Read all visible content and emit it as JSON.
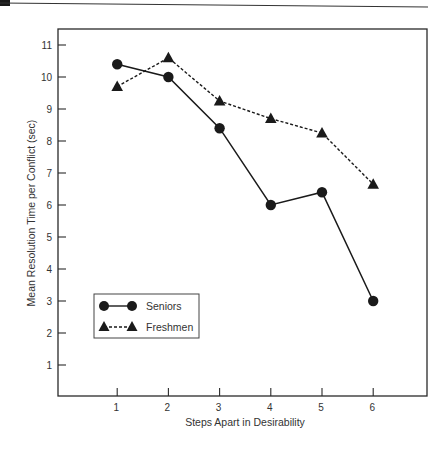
{
  "chart_data": {
    "type": "line",
    "title": "",
    "xlabel": "Steps Apart in Desirability",
    "ylabel": "Mean Resolution Time per Conflict (sec)",
    "x": [
      1,
      2,
      3,
      4,
      5,
      6
    ],
    "xticks": [
      "1",
      "2",
      "3",
      "4",
      "5",
      "6"
    ],
    "yticks": [
      "1",
      "2",
      "3",
      "4",
      "5",
      "6",
      "7",
      "8",
      "9",
      "10",
      "11"
    ],
    "ylim": [
      0,
      11.5
    ],
    "xlim": [
      0,
      7
    ],
    "grid": false,
    "legend_position": "lower-left (inside plot)",
    "series": [
      {
        "name": "Seniors",
        "marker": "circle",
        "line": "solid",
        "values": [
          10.4,
          10.0,
          8.4,
          6.0,
          6.4,
          3.0
        ]
      },
      {
        "name": "Freshmen",
        "marker": "triangle",
        "line": "dashed",
        "values": [
          9.7,
          10.6,
          9.25,
          8.7,
          8.25,
          6.65
        ]
      }
    ]
  },
  "colors": {
    "ink": "#1a1a1a",
    "background": "#ffffff"
  }
}
